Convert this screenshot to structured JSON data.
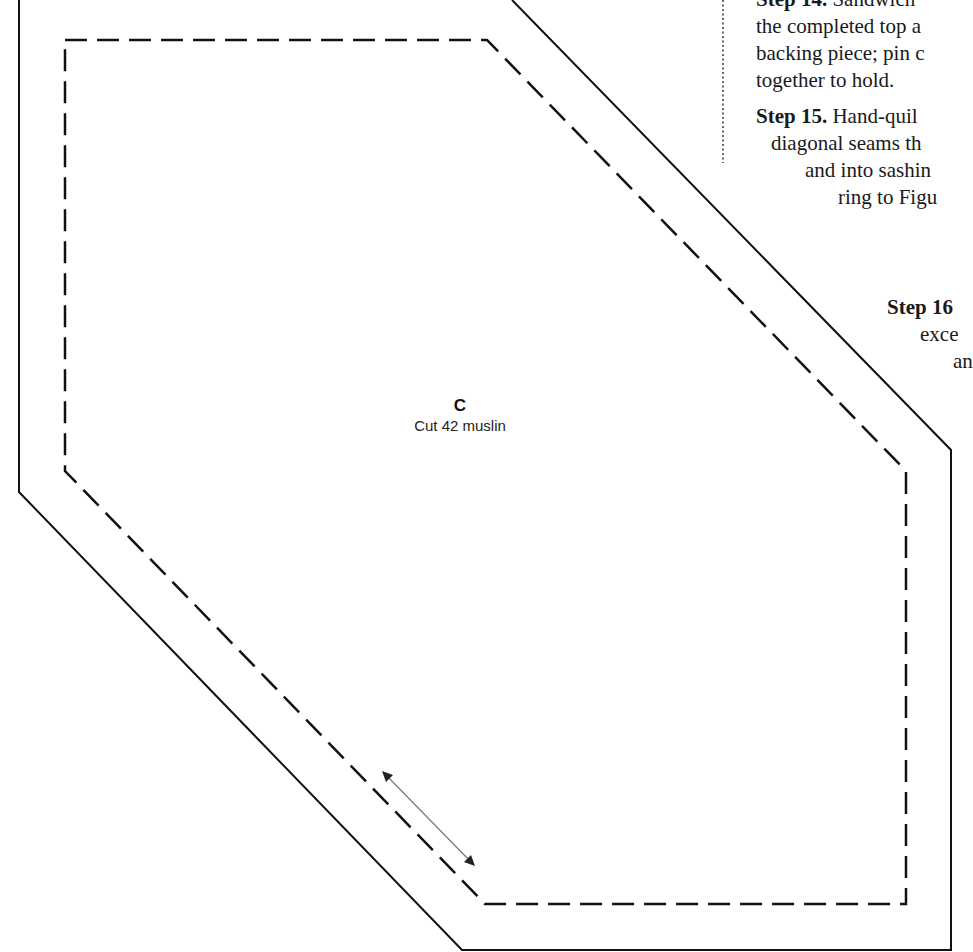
{
  "pattern": {
    "piece_letter": "C",
    "cut_instruction": "Cut 42 muslin"
  },
  "instructions": {
    "step14": {
      "label": "Step 14.",
      "lines": [
        "Sandwich",
        "the completed top a",
        "backing piece; pin c",
        "together to hold."
      ]
    },
    "step15": {
      "label": "Step 15.",
      "lines": [
        "Hand-quil",
        "diagonal seams th",
        "and into sashin",
        "ring to Figu"
      ]
    },
    "step16": {
      "label": "Step 16",
      "lines": [
        "exce",
        "an"
      ]
    }
  }
}
